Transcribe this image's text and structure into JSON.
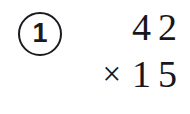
{
  "problem": {
    "number_label": "1",
    "marker_shape": "circle",
    "ink_color": "#16161c",
    "background_color": "#ffffff",
    "operand_top": "42",
    "operator_symbol": "×",
    "operand_bottom": "15",
    "operator_name": "multiplication-sign",
    "has_answer_rule": false,
    "answer_value": ""
  }
}
